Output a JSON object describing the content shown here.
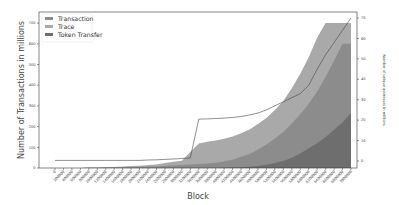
{
  "chart_data": {
    "type": "area",
    "title": "",
    "xlabel": "Block",
    "ylabel": "Number of Transactions in millions",
    "y2label": "Number of unique addresses in millions",
    "ylim": [
      0,
      740
    ],
    "y2lim": [
      -3.3,
      70
    ],
    "yticks": [
      0,
      100,
      200,
      300,
      400,
      500,
      600,
      700
    ],
    "y2ticks": [
      0,
      10,
      20,
      30,
      40,
      50,
      60,
      70
    ],
    "grid": false,
    "legend_position": "upper left",
    "legend": [
      "Transaction",
      "Trace",
      "Token Transfer"
    ],
    "x": [
      0,
      200000,
      400000,
      600000,
      800000,
      1000000,
      1200000,
      1400000,
      1600000,
      1800000,
      2000000,
      2200000,
      2400000,
      2600000,
      2800000,
      3000000,
      3200000,
      3400000,
      3600000,
      3800000,
      4000000,
      4200000,
      4400000,
      4600000,
      4800000,
      5000000,
      5200000,
      5400000,
      5600000,
      5800000,
      6000000,
      6200000,
      6400000,
      6600000,
      6800000,
      7000000
    ],
    "xtick_labels": [
      "0",
      "200000",
      "400000",
      "600000",
      "800000",
      "1000000",
      "1200000",
      "1400000",
      "1600000",
      "1800000",
      "2000000",
      "2200000",
      "2400000",
      "2600000",
      "2800000",
      "3000000",
      "3200000",
      "3400000",
      "3600000",
      "3800000",
      "4000000",
      "4200000",
      "4400000",
      "4600000",
      "4800000",
      "5000000",
      "5200000",
      "5400000",
      "5600000",
      "5800000",
      "6000000",
      "6200000",
      "6400000",
      "6600000",
      "6800000",
      "7000000"
    ],
    "series": [
      {
        "name": "Token Transfer",
        "color": "#6e6e6e",
        "stack_top": [
          0,
          0,
          0,
          0,
          0,
          0,
          0,
          0,
          0,
          0,
          0,
          0,
          0,
          0,
          0,
          0,
          0,
          0,
          0,
          0,
          1,
          2,
          4,
          6,
          10,
          16,
          24,
          34,
          50,
          70,
          95,
          120,
          150,
          185,
          220,
          265
        ]
      },
      {
        "name": "Transaction",
        "color": "#8c8c8c",
        "stack_top": [
          0,
          0,
          0,
          0,
          1,
          1,
          2,
          2,
          3,
          4,
          5,
          6,
          7,
          10,
          12,
          15,
          17,
          19,
          22,
          25,
          30,
          38,
          50,
          62,
          80,
          98,
          118,
          140,
          165,
          190,
          215,
          250,
          290,
          335,
          390,
          450
        ]
      },
      {
        "name": "Trace",
        "color": "#a9a9a9",
        "stack_top": [
          0,
          0,
          0,
          0,
          1,
          1,
          2,
          3,
          4,
          5,
          6,
          8,
          10,
          14,
          18,
          20,
          60,
          100,
          105,
          108,
          110,
          112,
          114,
          118,
          122,
          128,
          138,
          150,
          170,
          195,
          225,
          260,
          290,
          320,
          360,
          420
        ]
      },
      {
        "name": "Unique addresses (millions, right axis)",
        "type": "line",
        "color": "#444444",
        "values": [
          0.3,
          0.3,
          0.3,
          0.3,
          0.3,
          0.3,
          0.3,
          0.3,
          0.3,
          0.3,
          0.3,
          0.5,
          0.6,
          0.8,
          1.0,
          1.2,
          1.5,
          20.5,
          20.6,
          20.8,
          21.0,
          21.3,
          21.8,
          22.5,
          23.5,
          25,
          27,
          29,
          31,
          33,
          37,
          45,
          52,
          58,
          64,
          70
        ]
      }
    ],
    "area_totals_note": "stacked areas top out near 700M at the final block"
  }
}
